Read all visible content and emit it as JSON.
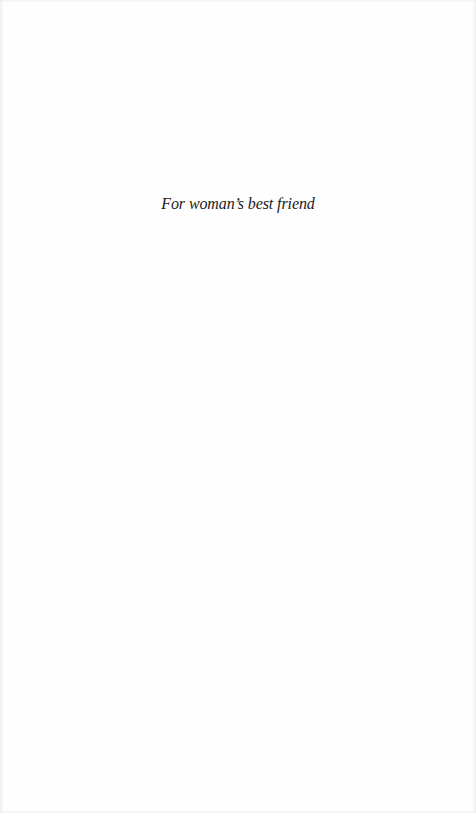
{
  "page": {
    "dedication": "For woman’s best friend"
  }
}
